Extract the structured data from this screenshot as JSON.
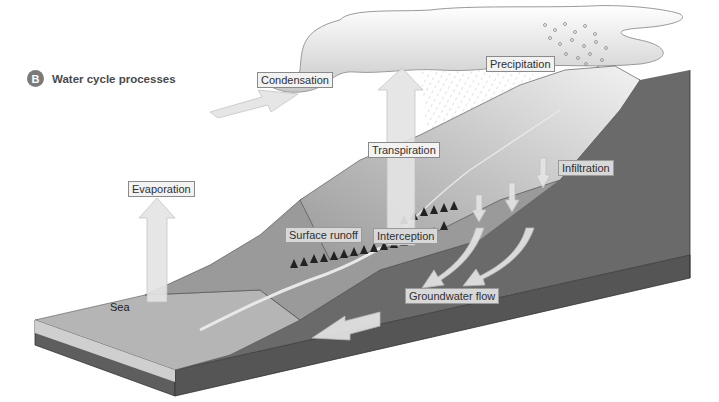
{
  "heading": {
    "badge": "B",
    "title": "Water cycle processes"
  },
  "labels": {
    "condensation": "Condensation",
    "precipitation": "Precipitation",
    "transpiration": "Transpiration",
    "infiltration": "Infiltration",
    "evaporation": "Evaporation",
    "surface_runoff": "Surface runoff",
    "interception": "Interception",
    "groundwater_flow": "Groundwater flow",
    "sea": "Sea"
  },
  "colors": {
    "badge": "#7a7a7a",
    "ground_dark": "#6a6a6a",
    "land_mid": "#9a9a9a",
    "sea_surface": "#b5b5b5",
    "arrow_fill": "#e4e4e4",
    "cloud_fill": "#f4f4f4"
  }
}
